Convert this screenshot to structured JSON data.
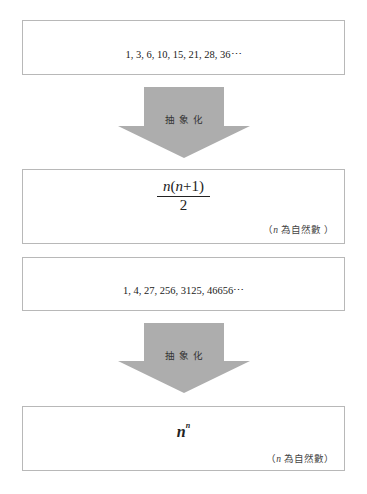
{
  "section1": {
    "sequence": "1, 3, 6, 10, 15, 21, 28, 36⋯",
    "arrow_label": "抽象化",
    "formula": {
      "numerator_italic": "n",
      "numerator_rest": "(",
      "numerator_n2": "n",
      "numerator_end": "+1)",
      "denominator": "2"
    },
    "note_open": "（",
    "note_var": "n",
    "note_text": " 為自然數 ）"
  },
  "section2": {
    "sequence": "1, 4, 27, 256, 3125, 46656⋯",
    "arrow_label": "抽象化",
    "formula": {
      "base": "n",
      "exponent": "n"
    },
    "note_open": "（",
    "note_var": "n",
    "note_text": " 為自然數）"
  },
  "colors": {
    "arrow_fill": "#adadad",
    "box_border": "#b8b8b8"
  }
}
